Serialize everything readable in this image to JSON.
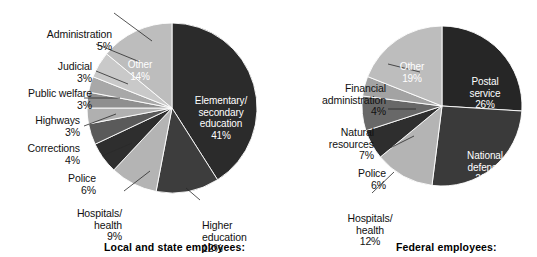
{
  "chart_data": [
    {
      "type": "pie",
      "title": "Local and state employees:",
      "categories": [
        "Elementary/\nsecondary\neducation",
        "Higher\neducation",
        "Hospitals/\nhealth",
        "Police",
        "Corrections",
        "Highways",
        "Public welfare",
        "Judicial",
        "Administration",
        "Other"
      ],
      "values": [
        41,
        12,
        9,
        6,
        4,
        3,
        3,
        3,
        5,
        14
      ],
      "labels": [
        "41%",
        "12%",
        "9%",
        "6%",
        "4%",
        "3%",
        "3%",
        "3%",
        "5%",
        "14%"
      ],
      "colors": [
        "#2b2b2b",
        "#3d3d3d",
        "#b4b4b4",
        "#2e2e2e",
        "#5a5a5a",
        "#b0b0b0",
        "#8f8f8f",
        "#a8a8a8",
        "#c9c9c9",
        "#bdbdbd"
      ],
      "legend": "none",
      "grid": false
    },
    {
      "type": "pie",
      "title": "Federal employees:",
      "categories": [
        "Postal\nservice",
        "National\ndefense",
        "Hospitals/\nhealth",
        "Police",
        "Natural\nresources",
        "Financial\nadministration",
        "Other"
      ],
      "values": [
        26,
        26,
        12,
        6,
        7,
        4,
        19
      ],
      "labels": [
        "26%",
        "26%",
        "12%",
        "6%",
        "7%",
        "4%",
        "19%"
      ],
      "colors": [
        "#262626",
        "#3a3a3a",
        "#b4b4b4",
        "#2e2e2e",
        "#686868",
        "#a3a3a3",
        "#bdbdbd"
      ],
      "legend": "none",
      "grid": false
    }
  ],
  "left_chart": {
    "caption": "Local and state employees:",
    "inner_labels": [
      {
        "name": "elementary-secondary-education",
        "text": "Elementary/\nsecondary\neducation\n41%"
      },
      {
        "name": "other",
        "text": "Other\n14%"
      }
    ],
    "outer_labels": [
      {
        "name": "administration",
        "text": "Administration\n5%"
      },
      {
        "name": "judicial",
        "text": "Judicial\n3%"
      },
      {
        "name": "public-welfare",
        "text": "Public welfare\n3%"
      },
      {
        "name": "highways",
        "text": "Highways\n3%"
      },
      {
        "name": "corrections",
        "text": "Corrections\n4%"
      },
      {
        "name": "police",
        "text": "Police\n6%"
      },
      {
        "name": "hospitals-health",
        "text": "Hospitals/\nhealth\n9%"
      },
      {
        "name": "higher-education",
        "text": "Higher\neducation\n12%"
      }
    ]
  },
  "right_chart": {
    "caption": "Federal employees:",
    "inner_labels": [
      {
        "name": "postal-service",
        "text": "Postal\nservice\n26%"
      },
      {
        "name": "national-defense",
        "text": "National\ndefense\n26%"
      },
      {
        "name": "other",
        "text": "Other\n19%"
      }
    ],
    "outer_labels": [
      {
        "name": "financial-administration",
        "text": "Financial\nadministration\n4%"
      },
      {
        "name": "natural-resources",
        "text": "Natural\nresources\n7%"
      },
      {
        "name": "police",
        "text": "Police\n6%"
      },
      {
        "name": "hospitals-health",
        "text": "Hospitals/\nhealth\n12%"
      }
    ]
  }
}
